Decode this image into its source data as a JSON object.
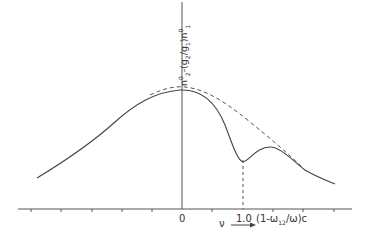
{
  "diagram": {
    "y_axis_label": {
      "n2": "n",
      "n2_sub": "2",
      "n2_sup": "0",
      "minus": "-(g",
      "g2_sub": "2",
      "slash": "/g",
      "g1_sub": "1",
      "close": ")n",
      "n1_sub": "1",
      "n1_sup": "0"
    },
    "y_axis_label_text": "n2^0 - (g2/g1) n1^0",
    "x_tick_labels": {
      "zero": "0",
      "one": "1.0",
      "unit": "(1-ω12/ω)c"
    },
    "unit_parts": {
      "open": "(1-ω",
      "sub": "12",
      "close": "/ω)c"
    },
    "x_variable": "ν",
    "x_arrow": "⟶",
    "curves": [
      {
        "name": "solid-curve",
        "style": "solid",
        "description": "spectral profile with dip at 1.0"
      },
      {
        "name": "dashed-curve",
        "style": "dashed",
        "description": "unperturbed envelope"
      }
    ],
    "colors": {
      "line": "#4a4a4a",
      "text": "#333333",
      "background": "#ffffff"
    }
  }
}
